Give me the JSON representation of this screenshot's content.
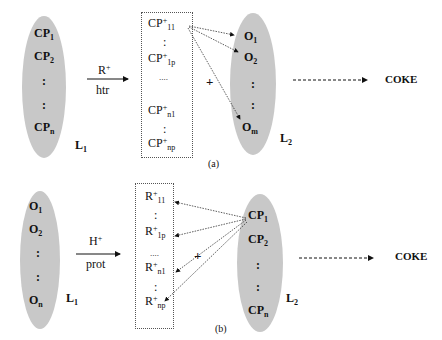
{
  "panel_a": {
    "caption": "(a)",
    "left_set": {
      "label_main": "L",
      "label_sub": "1",
      "items": [
        {
          "main": "CP",
          "sub": "1"
        },
        {
          "main": "CP",
          "sub": "2"
        },
        {
          "main": ":",
          "sub": ""
        },
        {
          "main": ":",
          "sub": ""
        },
        {
          "main": "CP",
          "sub": "n"
        }
      ]
    },
    "reaction_arrow": {
      "top": "R",
      "top_sup": "+",
      "bottom": "htr"
    },
    "intermediate_box": {
      "items": [
        {
          "main": "CP",
          "sup": "+",
          "sub": "11"
        },
        {
          "main": ":",
          "sup": "",
          "sub": ""
        },
        {
          "main": "CP",
          "sup": "+",
          "sub": "1p"
        },
        {
          "main": "....",
          "sup": "",
          "sub": ""
        },
        {
          "main": "CP",
          "sup": "+",
          "sub": "n1"
        },
        {
          "main": ":",
          "sup": "",
          "sub": ""
        },
        {
          "main": "CP",
          "sup": "+",
          "sub": "np"
        }
      ]
    },
    "plus": "+",
    "right_set": {
      "label_main": "L",
      "label_sub": "2",
      "items": [
        {
          "main": "O",
          "sub": "1"
        },
        {
          "main": "O",
          "sub": "2"
        },
        {
          "main": ":",
          "sub": ""
        },
        {
          "main": ":",
          "sub": ""
        },
        {
          "main": "O",
          "sub": "m"
        }
      ]
    },
    "product": "COKE"
  },
  "panel_b": {
    "caption": "(b)",
    "left_set": {
      "label_main": "L",
      "label_sub": "1",
      "items": [
        {
          "main": "O",
          "sub": "1"
        },
        {
          "main": "O",
          "sub": "2"
        },
        {
          "main": ":",
          "sub": ""
        },
        {
          "main": ":",
          "sub": ""
        },
        {
          "main": "O",
          "sub": "n"
        }
      ]
    },
    "reaction_arrow": {
      "top": "H",
      "top_sup": "+",
      "bottom": "prot"
    },
    "intermediate_box": {
      "items": [
        {
          "main": "R",
          "sup": "+",
          "sub": "11"
        },
        {
          "main": ":",
          "sup": "",
          "sub": ""
        },
        {
          "main": "R",
          "sup": "+",
          "sub": "1p"
        },
        {
          "main": "....",
          "sup": "",
          "sub": ""
        },
        {
          "main": "R",
          "sup": "+",
          "sub": "n1"
        },
        {
          "main": ":",
          "sup": "",
          "sub": ""
        },
        {
          "main": "R",
          "sup": "+",
          "sub": "np"
        }
      ]
    },
    "plus": "+",
    "right_set": {
      "label_main": "L",
      "label_sub": "2",
      "items": [
        {
          "main": "CP",
          "sub": "1"
        },
        {
          "main": "CP",
          "sub": "2"
        },
        {
          "main": ":",
          "sub": ""
        },
        {
          "main": ":",
          "sub": ""
        },
        {
          "main": "CP",
          "sub": "n"
        }
      ]
    },
    "product": "COKE"
  }
}
